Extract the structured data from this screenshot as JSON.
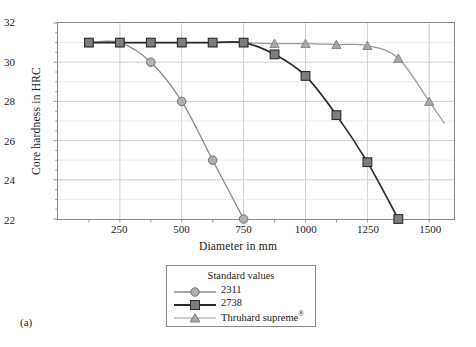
{
  "figure": {
    "panel_label": "(a)"
  },
  "chart_data": {
    "type": "line",
    "title": "",
    "xlabel": "Diameter in mm",
    "ylabel": "Core hardness in HRC",
    "xlim": [
      0,
      1600
    ],
    "ylim": [
      22,
      32
    ],
    "xticks": [
      250,
      500,
      750,
      1000,
      1250,
      1500
    ],
    "yticks": [
      22,
      24,
      26,
      28,
      30,
      32
    ],
    "xtick_labels": [
      "250",
      "500",
      "750",
      "1000",
      "1250",
      "1500"
    ],
    "ytick_labels": [
      "22",
      "24",
      "26",
      "28",
      "30",
      "32"
    ],
    "grid": true,
    "minor_ticks": true,
    "legend_position": "below-center",
    "legend_title": "Standard values",
    "series": [
      {
        "name": "2311",
        "marker": "circle",
        "color": "#8a8a8a",
        "marker_fill": "#b0b0b0",
        "x": [
          125,
          250,
          375,
          500,
          625,
          750
        ],
        "y": [
          31,
          31,
          30,
          28,
          25,
          22
        ]
      },
      {
        "name": "2738",
        "marker": "square",
        "color": "#2b2b2b",
        "marker_fill": "#7d7d7d",
        "x": [
          125,
          250,
          375,
          500,
          625,
          750,
          875,
          1000,
          1125,
          1250,
          1375
        ],
        "y": [
          31,
          31,
          31,
          31,
          31,
          31,
          30.4,
          29.3,
          27.3,
          24.9,
          22
        ]
      },
      {
        "name": "Thruhard supreme",
        "name_suffix": "®",
        "marker": "triangle",
        "color": "#9a9a9a",
        "marker_fill": "#a8a8a8",
        "x": [
          125,
          250,
          375,
          500,
          625,
          750,
          875,
          1000,
          1125,
          1250,
          1375,
          1500,
          1560
        ],
        "y": [
          31,
          31,
          31,
          31,
          31,
          31,
          30.95,
          30.95,
          30.9,
          30.85,
          30.2,
          28.0,
          26.9
        ]
      }
    ]
  },
  "legend": {
    "title": "Standard values",
    "entries": [
      {
        "label": "2311",
        "suffix": ""
      },
      {
        "label": "2738",
        "suffix": ""
      },
      {
        "label": "Thruhard supreme",
        "suffix": "®"
      }
    ]
  },
  "colors": {
    "axis": "#8a8a8a",
    "grid": "#c9c9c9",
    "background": "#ffffff",
    "series_2311": "#8a8a8a",
    "series_2738": "#2b2b2b",
    "series_thruhard": "#9a9a9a"
  }
}
